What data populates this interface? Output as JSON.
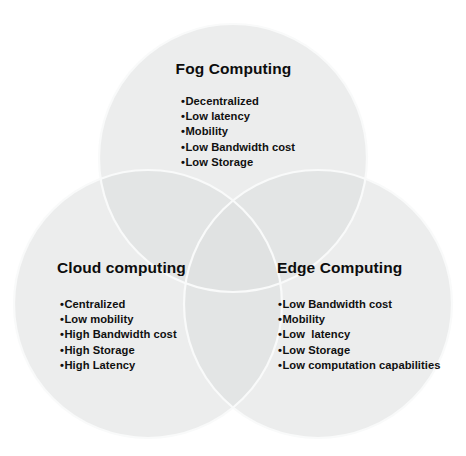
{
  "diagram": {
    "type": "venn-3-circle",
    "colors": {
      "background": "#ffffff",
      "circle_fill": "#eceded",
      "circle_overlap": "#e3e5e5",
      "circle_stroke": "#f7f8f8",
      "text": "#101010"
    },
    "circles": [
      {
        "id": "fog",
        "cx": 233,
        "cy": 158,
        "r": 134
      },
      {
        "id": "cloud",
        "cx": 148,
        "cy": 304,
        "r": 134
      },
      {
        "id": "edge",
        "cx": 318,
        "cy": 304,
        "r": 134
      }
    ]
  },
  "groups": {
    "fog": {
      "title": "Fog Computing",
      "items": [
        "Decentralized",
        "Low latency",
        "Mobility",
        "Low Bandwidth cost",
        "Low Storage"
      ]
    },
    "cloud": {
      "title": "Cloud computing",
      "items": [
        "Centralized",
        "Low mobility",
        "High Bandwidth cost",
        "High Storage",
        "High Latency"
      ]
    },
    "edge": {
      "title": "Edge Computing",
      "items": [
        "Low Bandwidth cost",
        "Mobility",
        "Low  latency",
        "Low Storage",
        "Low computation capabilities"
      ]
    }
  }
}
